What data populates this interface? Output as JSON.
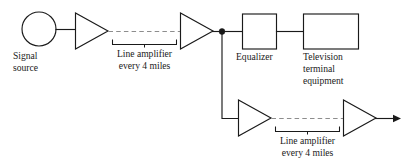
{
  "diagram": {
    "type": "block-diagram",
    "canvas": {
      "width": 408,
      "height": 167
    },
    "colors": {
      "line": "#1a1a1a",
      "dashed_line": "#8d8d8d",
      "shape_fill": "#ffffff",
      "background": "#ffffff",
      "text": "#1a1a1a"
    },
    "labels": {
      "signal_source_line1": "Signal",
      "signal_source_line2": "source",
      "line_amplifier_top_line1": "Line amplifier",
      "line_amplifier_top_line2": "every 4 miles",
      "equalizer": "Equalizer",
      "television_line1": "Television",
      "television_line2": "terminal",
      "television_line3": "equipment",
      "line_amplifier_bottom_line1": "Line amplifier",
      "line_amplifier_bottom_line2": "every 4 miles"
    },
    "nodes": [
      {
        "id": "signal-source",
        "shape": "circle",
        "label": "Signal source",
        "cx": 39,
        "cy": 29,
        "r": 17
      },
      {
        "id": "amplifier-top-1",
        "shape": "triangle",
        "label": "amplifier",
        "x": 75,
        "y": 13,
        "width": 33,
        "height": 36
      },
      {
        "id": "amplifier-top-2",
        "shape": "triangle",
        "label": "amplifier",
        "x": 180,
        "y": 13,
        "width": 33,
        "height": 36
      },
      {
        "id": "junction",
        "shape": "dot",
        "label": "junction node",
        "cx": 222,
        "cy": 32,
        "r": 2.8
      },
      {
        "id": "equalizer",
        "shape": "rect",
        "label": "Equalizer",
        "x": 242,
        "y": 14,
        "width": 34,
        "height": 35
      },
      {
        "id": "television-terminal-equipment",
        "shape": "rect",
        "label": "Television terminal equipment",
        "x": 303,
        "y": 14,
        "width": 55,
        "height": 35
      },
      {
        "id": "amplifier-bottom-1",
        "shape": "triangle",
        "label": "amplifier",
        "x": 238,
        "y": 100,
        "width": 33,
        "height": 36
      },
      {
        "id": "amplifier-bottom-2",
        "shape": "triangle",
        "label": "amplifier",
        "x": 343,
        "y": 100,
        "width": 33,
        "height": 36
      }
    ],
    "connections": [
      {
        "id": "source-to-amp1",
        "from": "signal-source",
        "to": "amplifier-top-1",
        "style": "solid"
      },
      {
        "id": "amp1-to-amp2",
        "from": "amplifier-top-1",
        "to": "amplifier-top-2",
        "style": "dashed",
        "note": "Line amplifier every 4 miles"
      },
      {
        "id": "amp2-to-junction",
        "from": "amplifier-top-2",
        "to": "junction",
        "style": "solid"
      },
      {
        "id": "junction-to-equalizer",
        "from": "junction",
        "to": "equalizer",
        "style": "solid"
      },
      {
        "id": "equalizer-to-television",
        "from": "equalizer",
        "to": "television-terminal-equipment",
        "style": "solid"
      },
      {
        "id": "junction-to-amp-bottom1",
        "from": "junction",
        "to": "amplifier-bottom-1",
        "style": "solid"
      },
      {
        "id": "amp-bottom1-to-amp-bottom2",
        "from": "amplifier-bottom-1",
        "to": "amplifier-bottom-2",
        "style": "dashed",
        "note": "Line amplifier every 4 miles"
      },
      {
        "id": "amp-bottom2-output",
        "from": "amplifier-bottom-2",
        "to": "output",
        "style": "solid-arrow"
      }
    ]
  }
}
